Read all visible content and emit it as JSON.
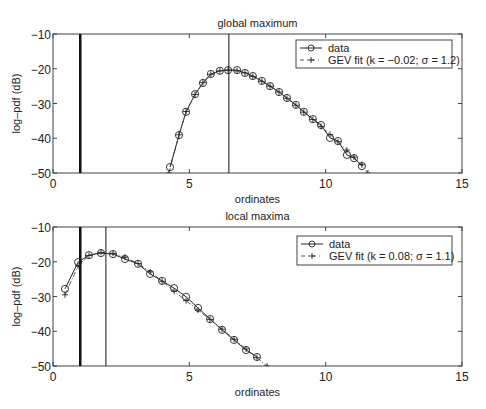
{
  "chart_data": [
    {
      "type": "line",
      "title": "global maximum",
      "xlabel": "ordinates",
      "ylabel": "log–pdf (dB)",
      "xlim": [
        0,
        15
      ],
      "ylim": [
        -50,
        -10
      ],
      "xticks": [
        0,
        5,
        10,
        15
      ],
      "yticks": [
        -10,
        -20,
        -30,
        -40,
        -50
      ],
      "xtick_labels": [
        "0",
        "5",
        "10",
        "15"
      ],
      "ytick_labels": [
        "−10",
        "−20",
        "−30",
        "−40",
        "−50"
      ],
      "grid": false,
      "legend_position": "upper right",
      "vertical_lines": [
        {
          "x": 1.0,
          "style": "thick"
        },
        {
          "x": 6.45,
          "style": "thin"
        }
      ],
      "series": [
        {
          "name": "data",
          "marker": "circle",
          "linestyle": "solid",
          "x": [
            4.29,
            4.62,
            4.88,
            5.21,
            5.5,
            5.79,
            6.12,
            6.42,
            6.75,
            7.04,
            7.33,
            7.66,
            7.96,
            8.29,
            8.58,
            8.91,
            9.2,
            9.53,
            9.83,
            10.16,
            10.45,
            10.78,
            11.04,
            11.33
          ],
          "y": [
            -48.3,
            -39.1,
            -32.4,
            -27.3,
            -24.1,
            -21.5,
            -20.6,
            -20.4,
            -20.4,
            -21.2,
            -22.1,
            -23.5,
            -25.0,
            -26.7,
            -28.4,
            -30.4,
            -32.4,
            -34.5,
            -36.2,
            -39.9,
            -40.8,
            -44.8,
            -45.7,
            -48.0
          ]
        },
        {
          "name": "GEV fit (k = −0.02; σ = 1.2)",
          "marker": "plus",
          "linestyle": "dashdot",
          "x": [
            4.25,
            4.62,
            4.88,
            5.21,
            5.5,
            5.79,
            6.12,
            6.42,
            6.75,
            7.04,
            7.33,
            7.66,
            7.96,
            8.29,
            8.58,
            8.91,
            9.2,
            9.53,
            9.83,
            10.16,
            10.45,
            10.78,
            11.04,
            11.33,
            11.55
          ],
          "y": [
            -50.0,
            -39.0,
            -32.3,
            -27.4,
            -24.0,
            -21.6,
            -20.6,
            -20.4,
            -20.6,
            -21.2,
            -22.2,
            -23.6,
            -25.0,
            -26.7,
            -28.5,
            -30.5,
            -32.5,
            -34.6,
            -36.6,
            -38.9,
            -41.0,
            -43.4,
            -45.4,
            -47.6,
            -50.0
          ]
        }
      ]
    },
    {
      "type": "line",
      "title": "local maxima",
      "xlabel": "ordinates",
      "ylabel": "log–pdf (dB)",
      "xlim": [
        0,
        15
      ],
      "ylim": [
        -50,
        -10
      ],
      "xticks": [
        0,
        5,
        10,
        15
      ],
      "yticks": [
        -10,
        -20,
        -30,
        -40,
        -50
      ],
      "xtick_labels": [
        "0",
        "5",
        "10",
        "15"
      ],
      "ytick_labels": [
        "−10",
        "−20",
        "−30",
        "−40",
        "−50"
      ],
      "grid": false,
      "legend_position": "upper right",
      "vertical_lines": [
        {
          "x": 1.0,
          "style": "thick"
        },
        {
          "x": 1.94,
          "style": "thin"
        }
      ],
      "series": [
        {
          "name": "data",
          "marker": "circle",
          "linestyle": "solid",
          "x": [
            0.44,
            0.92,
            1.32,
            1.76,
            2.2,
            2.64,
            3.12,
            3.56,
            4.0,
            4.44,
            4.88,
            5.32,
            5.76,
            6.2,
            6.64,
            7.08,
            7.48
          ],
          "y": [
            -27.8,
            -20.1,
            -18.1,
            -17.5,
            -17.8,
            -19.2,
            -20.6,
            -23.5,
            -25.5,
            -27.6,
            -30.1,
            -33.3,
            -36.5,
            -39.6,
            -42.5,
            -45.4,
            -47.4
          ]
        },
        {
          "name": "GEV fit (k = 0.08; σ = 1.1)",
          "marker": "plus",
          "linestyle": "dashdot",
          "x": [
            0.44,
            0.92,
            1.32,
            1.76,
            2.2,
            2.64,
            3.12,
            3.56,
            4.0,
            4.44,
            4.88,
            5.32,
            5.76,
            6.2,
            6.64,
            7.08,
            7.48,
            7.85
          ],
          "y": [
            -29.5,
            -21.2,
            -18.2,
            -17.3,
            -17.6,
            -18.7,
            -20.5,
            -22.9,
            -25.6,
            -28.5,
            -31.2,
            -33.9,
            -36.6,
            -39.4,
            -42.3,
            -45.1,
            -47.6,
            -50.0
          ]
        }
      ]
    }
  ],
  "plots": {
    "top": {
      "title": "global maximum",
      "xlabel": "ordinates",
      "ylabel": "log–pdf (dB)",
      "legend": [
        "data",
        "GEV fit (k = −0.02; σ = 1.2)"
      ]
    },
    "bottom": {
      "title": "local maxima",
      "xlabel": "ordinates",
      "ylabel": "log–pdf (dB)",
      "legend": [
        "data",
        "GEV fit (k = 0.08; σ = 1.1)"
      ]
    }
  }
}
